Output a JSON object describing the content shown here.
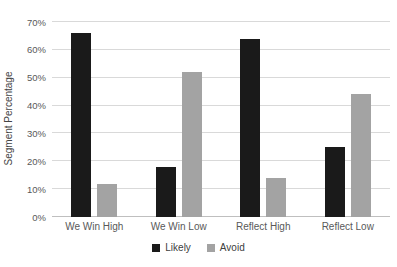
{
  "chart_data": {
    "type": "bar",
    "title": "",
    "xlabel": "",
    "ylabel": "Segment Percentage",
    "categories": [
      "We Win High",
      "We Win Low",
      "Reflect High",
      "Reflect Low"
    ],
    "series": [
      {
        "name": "Likely",
        "color": "#1a1a1a",
        "values": [
          66,
          18,
          64,
          25
        ]
      },
      {
        "name": "Avoid",
        "color": "#a3a3a3",
        "values": [
          12,
          52,
          14,
          44
        ]
      }
    ],
    "ylim": [
      0,
      70
    ],
    "ytick_step": 10,
    "yticks": [
      "0%",
      "10%",
      "20%",
      "30%",
      "40%",
      "50%",
      "60%",
      "70%"
    ],
    "grid": true,
    "legend_position": "bottom",
    "colors": {
      "background": "#ffffff",
      "gridline": "#d9d9d9",
      "axis_line": "#bfbfbf",
      "tick_text": "#595959",
      "legend_text": "#404040"
    }
  }
}
